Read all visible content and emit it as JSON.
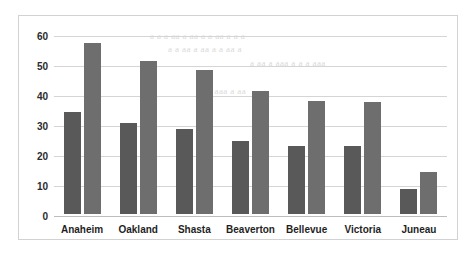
{
  "chart_data": {
    "type": "bar",
    "title": "",
    "subtitle": "",
    "xlabel": "",
    "ylabel": "",
    "ylim": [
      0,
      60
    ],
    "yticks": [
      0,
      10,
      20,
      30,
      40,
      50,
      60
    ],
    "grid": true,
    "legend": "none",
    "categories": [
      "Anaheim",
      "Oakland",
      "Shasta",
      "Beaverton",
      "Bellevue",
      "Victoria",
      "Juneau"
    ],
    "series": [
      {
        "name": "Series 1",
        "color": "#595959",
        "values": [
          34,
          30.5,
          28.5,
          24.3,
          22.8,
          22.6,
          8.5
        ]
      },
      {
        "name": "Series 2",
        "color": "#6e6e6e",
        "values": [
          57,
          51,
          48,
          41,
          37.8,
          37.4,
          14
        ]
      }
    ]
  },
  "background_text": {
    "note": "faint illegible bleed-through from reverse side of scanned page",
    "lines": [
      "a a   a  aa a aa   a  a aa  a a a",
      "a  a aa   a aa a   a  aa a",
      "a aa a  aaa  a a   a aaa",
      "aa  a aaa a  aa"
    ]
  },
  "colors": {
    "frame_border": "#d2d2d2",
    "gridline": "#d5d5d5",
    "baseline": "#bdbdbd",
    "tick_text": "#2b2b2b",
    "category_text": "#1f1f1f",
    "page_background": "#ffffff"
  }
}
